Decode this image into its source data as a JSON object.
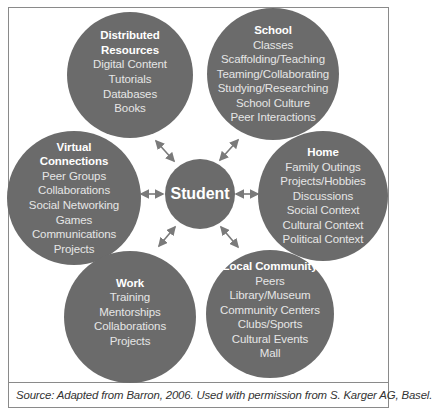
{
  "diagram": {
    "center": {
      "label": "Student"
    },
    "nodes": [
      {
        "id": "distributed-resources",
        "title_lines": [
          "Distributed",
          "Resources"
        ],
        "items": [
          "Digital Content",
          "Tutorials",
          "Databases",
          "Books"
        ]
      },
      {
        "id": "school",
        "title_lines": [
          "School"
        ],
        "items": [
          "Classes",
          "Scaffolding/Teaching",
          "Teaming/Collaborating",
          "Studying/Researching",
          "School Culture",
          "Peer Interactions"
        ]
      },
      {
        "id": "virtual-connections",
        "title_lines": [
          "Virtual",
          "Connections"
        ],
        "items": [
          "Peer Groups",
          "Collaborations",
          "Social Networking",
          "Games",
          "Communications",
          "Projects"
        ]
      },
      {
        "id": "home",
        "title_lines": [
          "Home"
        ],
        "items": [
          "Family Outings",
          "Projects/Hobbies",
          "Discussions",
          "Social Context",
          "Cultural Context",
          "Political Context"
        ]
      },
      {
        "id": "work",
        "title_lines": [
          "Work"
        ],
        "items": [
          "Training",
          "Mentorships",
          "Collaborations",
          "Projects"
        ]
      },
      {
        "id": "local-community",
        "title_lines": [
          "Local Community"
        ],
        "items": [
          "Peers",
          "Library/Museum",
          "Community Centers",
          "Clubs/Sports",
          "Cultural Events",
          "Mall"
        ]
      }
    ],
    "arrows": "bidirectional arrows connecting Student to each of the six surrounding circles",
    "colors": {
      "circle_fill": "#6b6b6b",
      "arrow": "#7a7a7a",
      "text": "#ffffff",
      "frame": "#8a8a8a"
    }
  },
  "source": "Source: Adapted from Barron, 2006. Used with permission from S. Karger AG, Basel."
}
